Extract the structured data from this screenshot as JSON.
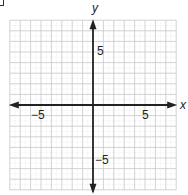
{
  "diagram": {
    "type": "coordinate-plane",
    "x_axis": {
      "name": "x",
      "range": [
        -8,
        8
      ],
      "labeled_ticks": [
        {
          "value": -5,
          "label": "−5"
        },
        {
          "value": 5,
          "label": "5"
        }
      ]
    },
    "y_axis": {
      "name": "y",
      "range": [
        -8,
        8
      ],
      "labeled_ticks": [
        {
          "value": 5,
          "label": "5"
        },
        {
          "value": -5,
          "label": "−5"
        }
      ]
    },
    "grid": {
      "step": 1,
      "minor_dashed": true
    },
    "colors": {
      "grid": "#c8c8c8",
      "axis": "#222222"
    }
  }
}
